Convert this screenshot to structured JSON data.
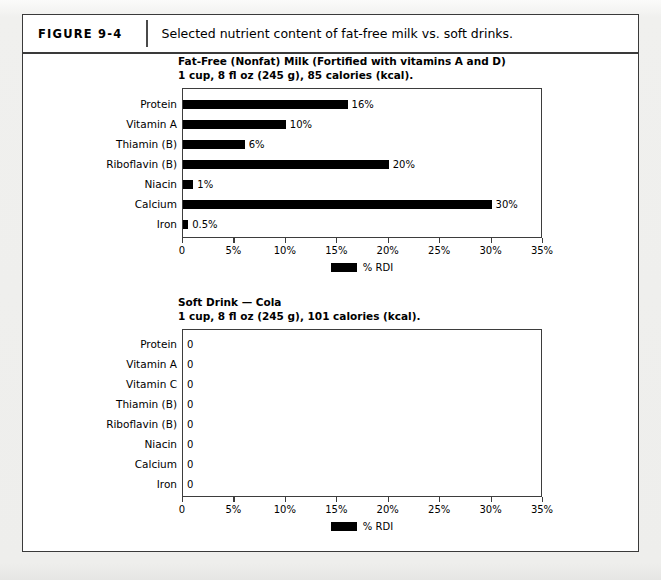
{
  "figure": {
    "label": "FIGURE 9-4",
    "caption": "Selected nutrient content of fat-free milk vs. soft drinks."
  },
  "charts": [
    {
      "id": "chart-1",
      "title_line1": "Fat-Free (Nonfat) Milk (Fortified with vitamins A and D)",
      "title_line2": "1 cup, 8 fl oz (245 g), 85 calories (kcal).",
      "legend_label": "% RDI"
    },
    {
      "id": "chart-2",
      "title_line1": "Soft Drink — Cola",
      "title_line2": "1 cup, 8 fl oz (245 g), 101 calories (kcal).",
      "legend_label": "% RDI"
    }
  ],
  "chart_data": [
    {
      "type": "bar",
      "orientation": "horizontal",
      "title": "Fat-Free (Nonfat) Milk (Fortified with vitamins A and D) — 1 cup, 8 fl oz (245 g), 85 calories (kcal).",
      "xlabel": "",
      "ylabel": "",
      "categories": [
        "Protein",
        "Vitamin A",
        "Thiamin (B)",
        "Riboflavin (B)",
        "Niacin",
        "Calcium",
        "Iron"
      ],
      "values": [
        16,
        10,
        6,
        20,
        1,
        30,
        0.5
      ],
      "value_labels": [
        "16%",
        "10%",
        "6%",
        "20%",
        "1%",
        "30%",
        "0.5%"
      ],
      "xlim": [
        0,
        35
      ],
      "xticks": [
        0,
        5,
        10,
        15,
        20,
        25,
        30,
        35
      ],
      "xticklabels": [
        "0",
        "5%",
        "10%",
        "15%",
        "20%",
        "25%",
        "30%",
        "35%"
      ],
      "grid": false,
      "legend": [
        "% RDI"
      ],
      "legend_position": "bottom-center",
      "bar_color": "#000000"
    },
    {
      "type": "bar",
      "orientation": "horizontal",
      "title": "Soft Drink — Cola — 1 cup, 8 fl oz (245 g), 101 calories (kcal).",
      "xlabel": "",
      "ylabel": "",
      "categories": [
        "Protein",
        "Vitamin A",
        "Vitamin C",
        "Thiamin (B)",
        "Riboflavin (B)",
        "Niacin",
        "Calcium",
        "Iron"
      ],
      "values": [
        0,
        0,
        0,
        0,
        0,
        0,
        0,
        0
      ],
      "value_labels": [
        "0",
        "0",
        "0",
        "0",
        "0",
        "0",
        "0",
        "0"
      ],
      "xlim": [
        0,
        35
      ],
      "xticks": [
        0,
        5,
        10,
        15,
        20,
        25,
        30,
        35
      ],
      "xticklabels": [
        "0",
        "5%",
        "10%",
        "15%",
        "20%",
        "25%",
        "30%",
        "35%"
      ],
      "grid": false,
      "legend": [
        "% RDI"
      ],
      "legend_position": "bottom-center",
      "bar_color": "#000000"
    }
  ]
}
